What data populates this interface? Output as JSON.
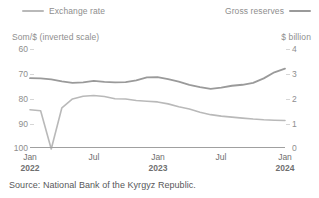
{
  "legend": {
    "exchange_rate": {
      "label": "Exchange rate",
      "color": "#b9b9b9",
      "icon": "line-swatch-icon"
    },
    "gross_reserves": {
      "label": "Gross reserves",
      "color": "#9a9a9a",
      "icon": "line-swatch-icon"
    }
  },
  "axes": {
    "left_unit": "Som/$ (inverted scale)",
    "right_unit": "$ billion",
    "left_ticks": [
      "60",
      "70",
      "80",
      "90",
      "100"
    ],
    "right_ticks": [
      "4",
      "3",
      "2",
      "1",
      "0"
    ],
    "x_ticks": [
      {
        "month": "Jan",
        "year": "2022"
      },
      {
        "month": "Jul",
        "year": ""
      },
      {
        "month": "Jan",
        "year": "2023"
      },
      {
        "month": "Jul",
        "year": ""
      },
      {
        "month": "Jan",
        "year": "2024"
      }
    ]
  },
  "source": "Source: National Bank of the Kyrgyz Republic.",
  "chart_data": {
    "type": "line",
    "title": "",
    "xlabel": "",
    "ylabel": "Som/$ (inverted scale)",
    "y2label": "$ billion",
    "grid": false,
    "legend_position": "top",
    "ylim": [
      60,
      100
    ],
    "y_inverted": true,
    "y2lim": [
      0,
      4
    ],
    "x": [
      "2022-01",
      "2022-02",
      "2022-03",
      "2022-04",
      "2022-05",
      "2022-06",
      "2022-07",
      "2022-08",
      "2022-09",
      "2022-10",
      "2022-11",
      "2022-12",
      "2023-01",
      "2023-02",
      "2023-03",
      "2023-04",
      "2023-05",
      "2023-06",
      "2023-07",
      "2023-08",
      "2023-09",
      "2023-10",
      "2023-11",
      "2023-12",
      "2024-01"
    ],
    "series": [
      {
        "name": "Exchange rate",
        "axis": "left",
        "unit": "Som/$",
        "color": "#b9b9b9",
        "values": [
          84.8,
          85.2,
          100.8,
          84.0,
          80.4,
          79.3,
          79.0,
          79.4,
          80.3,
          80.4,
          81.0,
          81.3,
          81.6,
          82.4,
          83.6,
          84.5,
          85.8,
          86.8,
          87.4,
          87.8,
          88.2,
          88.6,
          88.9,
          89.1,
          89.2
        ]
      },
      {
        "name": "Gross reserves",
        "axis": "right",
        "unit": "$ billion",
        "color": "#9a9a9a",
        "values": [
          2.81,
          2.8,
          2.76,
          2.68,
          2.62,
          2.64,
          2.7,
          2.66,
          2.64,
          2.65,
          2.72,
          2.84,
          2.85,
          2.77,
          2.67,
          2.54,
          2.44,
          2.37,
          2.42,
          2.5,
          2.54,
          2.62,
          2.8,
          3.05,
          3.2
        ]
      }
    ]
  }
}
